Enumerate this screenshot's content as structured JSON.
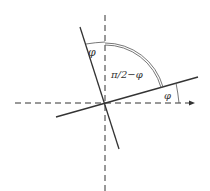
{
  "diagram": {
    "title": "",
    "labels": {
      "phi_top": "φ",
      "complement": "π/2−φ",
      "phi_right": "φ"
    },
    "elements": {
      "horizontal_axis": {
        "style": "dashed",
        "role": "reference x-axis"
      },
      "vertical_axis": {
        "style": "dashed",
        "role": "reference y-axis"
      },
      "rotated_x_axis": {
        "style": "solid",
        "role": "axis rotated by φ"
      },
      "rotated_y_axis": {
        "style": "solid",
        "role": "axis rotated by φ"
      },
      "complement_arc": {
        "style": "double",
        "spans": "π/2−φ"
      }
    },
    "colors": {
      "line": "#333333",
      "background": "#ffffff"
    }
  }
}
